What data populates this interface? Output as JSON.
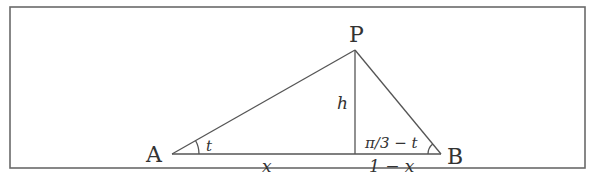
{
  "diagram": {
    "type": "triangle-with-altitude",
    "frame": {
      "x": 10,
      "y": 7,
      "width": 575,
      "height": 161,
      "stroke": "#666666"
    },
    "stroke_color": "#555555",
    "vertices": {
      "A": {
        "label": "A",
        "x": 172,
        "y": 154
      },
      "P": {
        "label": "P",
        "x": 355,
        "y": 50
      },
      "B": {
        "label": "B",
        "x": 441,
        "y": 154
      },
      "foot": {
        "x": 355,
        "y": 154
      }
    },
    "labels": {
      "angle_a": "t",
      "angle_b": "π/3 − t",
      "height": "h",
      "base_left": "x",
      "base_right": "1 − x"
    }
  }
}
